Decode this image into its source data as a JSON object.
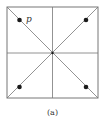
{
  "diagram": {
    "caption": "(a)",
    "point_label": "p",
    "square": {
      "x": 7,
      "y": 7,
      "size": 91
    },
    "center": {
      "x": 52.5,
      "y": 52.5
    },
    "points": [
      {
        "name": "top-left",
        "x": 19,
        "y": 20,
        "labeled": true
      },
      {
        "name": "top-right",
        "x": 86,
        "y": 20
      },
      {
        "name": "bottom-left",
        "x": 19,
        "y": 87
      },
      {
        "name": "bottom-right",
        "x": 86,
        "y": 87
      }
    ],
    "colors": {
      "line": "#777777",
      "dot": "#1a1a1a"
    }
  }
}
